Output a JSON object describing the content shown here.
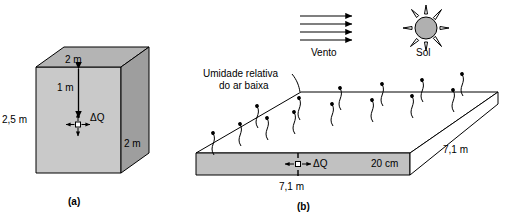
{
  "figure": {
    "title_hidden": "",
    "colors": {
      "front_face": "#c9c9c9",
      "top_face": "#b4b4b4",
      "side_face": "#9e9e9e",
      "slab_front": "#c1c1c1",
      "sun_fill": "#b0b0b0",
      "stroke": "#000000",
      "background": "#ffffff"
    }
  },
  "panel_a": {
    "caption": "(a)",
    "dim_top": "2 m",
    "dim_left": "2,5 m",
    "dim_right": "2 m",
    "dim_depth_inner": "1 m",
    "flux_label": "ΔQ"
  },
  "panel_b": {
    "caption": "(b)",
    "wind_label": "Vento",
    "sun_label": "Sol",
    "humidity_line1": "Umidade relativa",
    "humidity_line2": "do ar baixa",
    "dim_thickness": "20 cm",
    "dim_depth": "7,1 m",
    "dim_width": "7,1 m",
    "flux_label": "ΔQ",
    "wind_arrow_count": 4,
    "sun_ray_count": 8,
    "evaporation_arrow_count": 14
  }
}
